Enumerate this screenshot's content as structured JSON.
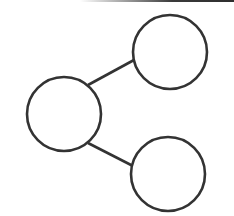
{
  "diagram": {
    "type": "node-link",
    "stroke_color": "#333333",
    "fill_color": "#ffffff",
    "nodes": [
      {
        "id": "left",
        "cx": 64,
        "cy": 114,
        "r": 37,
        "label": ""
      },
      {
        "id": "top-right",
        "cx": 170,
        "cy": 52,
        "r": 37,
        "label": ""
      },
      {
        "id": "bottom-right",
        "cx": 168,
        "cy": 174,
        "r": 37,
        "label": ""
      }
    ],
    "edges": [
      {
        "from": "left",
        "to": "top-right",
        "x1": 88,
        "y1": 85,
        "x2": 134,
        "y2": 60
      },
      {
        "from": "left",
        "to": "bottom-right",
        "x1": 88,
        "y1": 143,
        "x2": 133,
        "y2": 166
      }
    ]
  }
}
